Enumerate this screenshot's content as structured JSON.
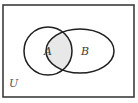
{
  "diagram": {
    "type": "venn",
    "universe_label": "U",
    "sets": [
      {
        "label": "A",
        "shape": "circle",
        "cx": 48,
        "cy": 51,
        "rx": 24,
        "ry": 24
      },
      {
        "label": "B",
        "shape": "ellipse",
        "cx": 80,
        "cy": 51,
        "rx": 34,
        "ry": 22
      }
    ],
    "shaded_region": "A ∩ B",
    "colors": {
      "stroke": "#1e1e1e",
      "frame": "#3c3c3c",
      "shade": "#e8e8e8",
      "background": "#ffffff"
    }
  }
}
